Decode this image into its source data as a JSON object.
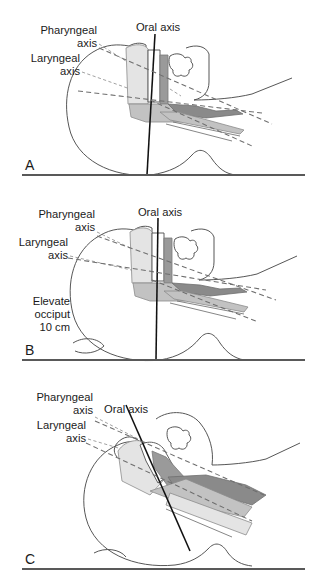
{
  "figure": {
    "background": "#ffffff",
    "ink": "#1a1a1a",
    "baseline_color": "#595959",
    "axis_solid_color": "#111111",
    "axis_dashed_color": "#6e6e6e"
  },
  "labels": {
    "oral_axis": "Oral axis",
    "pharyngeal": "Pharyngeal",
    "laryngeal": "Laryngeal",
    "axis": "axis",
    "elevate": "Elevate",
    "occiput": "occiput",
    "ten_cm": "10 cm"
  },
  "panels": [
    {
      "id": "A",
      "letter": "A",
      "caption": "Supine, head neutral on flat surface; oral, pharyngeal and laryngeal axes diverge",
      "labels": [
        "Pharyngeal",
        "axis",
        "Laryngeal",
        "axis",
        "Oral axis"
      ]
    },
    {
      "id": "B",
      "letter": "B",
      "caption": "Occiput elevated 10 cm; pharyngeal and laryngeal axes aligned",
      "labels": [
        "Pharyngeal",
        "axis",
        "Laryngeal",
        "axis",
        "Oral axis",
        "Elevate",
        "occiput",
        "10 cm"
      ]
    },
    {
      "id": "C",
      "letter": "C",
      "caption": "Head extended at atlanto-occipital joint (sniffing position); all three axes aligned",
      "labels": [
        "Pharyngeal",
        "axis",
        "Laryngeal",
        "axis",
        "Oral axis"
      ]
    }
  ],
  "axes": [
    {
      "name": "Oral axis",
      "style": "solid"
    },
    {
      "name": "Pharyngeal axis",
      "style": "dashed"
    },
    {
      "name": "Laryngeal axis",
      "style": "dashed"
    }
  ]
}
